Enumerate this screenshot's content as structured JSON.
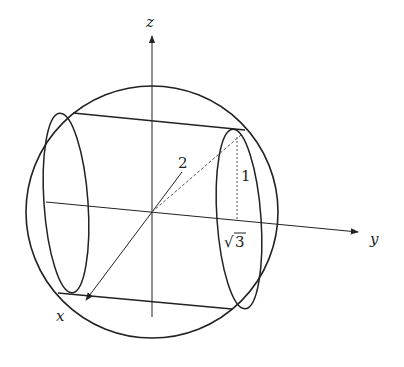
{
  "figure": {
    "stroke_color": "#222222",
    "background": "#ffffff"
  },
  "axes": {
    "x_label": "x",
    "y_label": "y",
    "z_label": "z"
  },
  "annotations": {
    "radius_label": "2",
    "half_height_label": "1",
    "sqrt_symbol": "√",
    "radial_value": "3"
  },
  "geometry": {
    "sphere": {
      "cx": 152,
      "cy": 212,
      "r": 126
    },
    "origin": {
      "x": 152,
      "y": 212
    },
    "z_axis": {
      "x1": 152,
      "y1": 317,
      "x2": 152,
      "y2": 36
    },
    "y_axis": {
      "x1": 46,
      "y1": 202,
      "x2": 358,
      "y2": 232
    },
    "x_axis": {
      "x1": 182,
      "y1": 172,
      "x2": 86,
      "y2": 300
    },
    "left_cap": {
      "cx": 66,
      "cy": 203,
      "rx": 22,
      "ry": 90,
      "rotate": -4
    },
    "right_cap": {
      "cx": 239,
      "cy": 219,
      "rx": 22,
      "ry": 90,
      "rotate": -4
    },
    "top_edge": {
      "x1": 73,
      "y1": 113,
      "x2": 245,
      "y2": 130
    },
    "bottom_edge": {
      "x1": 58,
      "y1": 293,
      "x2": 232,
      "y2": 309
    },
    "radius_segment": {
      "x1": 152,
      "y1": 212,
      "x2": 241,
      "y2": 135
    },
    "height_segment": {
      "x1": 237,
      "y1": 137,
      "x2": 237,
      "y2": 220
    }
  }
}
